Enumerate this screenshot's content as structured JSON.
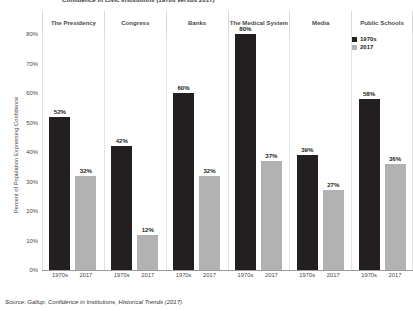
{
  "title": "Confidence in Civic Institutions (1970s versus 2017)",
  "source": "Source: Gallup. Confidence in Institutions, Historical Trends (2017).",
  "legend": {
    "items": [
      {
        "label": "1970s",
        "color": "#231f20"
      },
      {
        "label": "2017",
        "color": "#b2b2b2"
      }
    ]
  },
  "axis": {
    "ylabel": "Percent of Population Expressing Confidence",
    "yticks": [
      "0%",
      "10%",
      "20%",
      "30%",
      "40%",
      "50%",
      "60%",
      "70%",
      "80%"
    ]
  },
  "headers": [
    {
      "label": "The Presidency"
    },
    {
      "label": "Congress"
    },
    {
      "label": "Banks"
    },
    {
      "label": "The Medical System"
    },
    {
      "label": "Media"
    },
    {
      "label": "Public Schools"
    }
  ],
  "xticks": [
    "1970s",
    "2017",
    "1970s",
    "2017",
    "1970s",
    "2017",
    "1970s",
    "2017",
    "1970s",
    "2017",
    "1970s",
    "2017"
  ],
  "chart_data": {
    "type": "bar",
    "title": "Confidence in Civic Institutions (1970s versus 2017)",
    "xlabel": "",
    "ylabel": "Percent of Population Expressing Confidence",
    "ylim": [
      0,
      80
    ],
    "ytick_step": 10,
    "grid": false,
    "legend_position": "top-right",
    "categories": [
      "The Presidency",
      "Congress",
      "Banks",
      "The Medical System",
      "Media",
      "Public Schools"
    ],
    "series": [
      {
        "name": "1970s",
        "color": "#231f20",
        "values": [
          52,
          42,
          60,
          80,
          39,
          58
        ],
        "labels": [
          "52%",
          "42%",
          "60%",
          "80%",
          "39%",
          "58%"
        ]
      },
      {
        "name": "2017",
        "color": "#b2b2b2",
        "values": [
          32,
          12,
          32,
          37,
          27,
          36
        ],
        "labels": [
          "32%",
          "12%",
          "32%",
          "37%",
          "27%",
          "36%"
        ]
      }
    ]
  }
}
